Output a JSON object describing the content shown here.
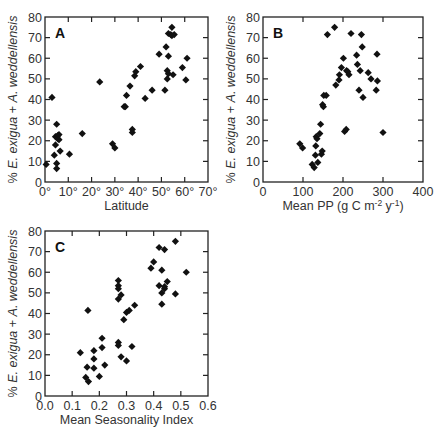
{
  "chart_data": [
    {
      "id": "A",
      "type": "scatter",
      "panel_label": "A",
      "title": "",
      "xlabel": "Latitude",
      "ylabel": "% E. exigua + A. weddellensis",
      "ylabel_parts": {
        "pre": "% ",
        "italic1": "E. exigua",
        "mid": " + ",
        "italic2": "A. weddellensis"
      },
      "xlim": [
        0,
        70
      ],
      "ylim": [
        0,
        80
      ],
      "xticks": [
        0,
        10,
        20,
        30,
        40,
        50,
        60,
        70
      ],
      "xtick_labels": [
        "0°",
        "10°",
        "20°",
        "30°",
        "40°",
        "50°",
        "60°",
        "70°"
      ],
      "yticks": [
        0,
        10,
        20,
        30,
        40,
        50,
        60,
        70,
        80
      ],
      "ytick_labels": [
        "0",
        "10",
        "20",
        "30",
        "40",
        "50",
        "60",
        "70",
        "80"
      ],
      "grid": false,
      "marker": "diamond",
      "points": [
        [
          0.5,
          8.5
        ],
        [
          3,
          41
        ],
        [
          4,
          13
        ],
        [
          4.5,
          18
        ],
        [
          4.5,
          22
        ],
        [
          5,
          28
        ],
        [
          5,
          9
        ],
        [
          5,
          6.5
        ],
        [
          5.5,
          22.5
        ],
        [
          5.5,
          21
        ],
        [
          6,
          23
        ],
        [
          6,
          20.5
        ],
        [
          6.5,
          15
        ],
        [
          10.5,
          13.5
        ],
        [
          16,
          23.5
        ],
        [
          23.5,
          48.5
        ],
        [
          29,
          18.5
        ],
        [
          30,
          16.5
        ],
        [
          34,
          36.5
        ],
        [
          34.5,
          36.5
        ],
        [
          35,
          42
        ],
        [
          36.5,
          46.5
        ],
        [
          37.5,
          25.5
        ],
        [
          37.5,
          24
        ],
        [
          38.5,
          51.5
        ],
        [
          39,
          53.5
        ],
        [
          41,
          56
        ],
        [
          43,
          40.5
        ],
        [
          46,
          44.5
        ],
        [
          49,
          62
        ],
        [
          51.5,
          44.5
        ],
        [
          52,
          65.5
        ],
        [
          52.5,
          50
        ],
        [
          52.5,
          54
        ],
        [
          53,
          72
        ],
        [
          53,
          61
        ],
        [
          53,
          52.5
        ],
        [
          54,
          71.5
        ],
        [
          54.5,
          75
        ],
        [
          54.5,
          71
        ],
        [
          55,
          52
        ],
        [
          55.5,
          71.5
        ],
        [
          59,
          55.5
        ],
        [
          60.5,
          49.5
        ],
        [
          61,
          60
        ]
      ]
    },
    {
      "id": "B",
      "type": "scatter",
      "panel_label": "B",
      "title": "",
      "xlabel": "Mean PP (g C m-2 y-1)",
      "xlabel_parts": {
        "main": "Mean PP (g C m",
        "sup1": "-2",
        "mid": " y",
        "sup2": "-1",
        "end": ")"
      },
      "ylabel": "% E. exigua + A. weddellensis",
      "ylabel_parts": {
        "pre": "% ",
        "italic1": "E. exigua",
        "mid": " + ",
        "italic2": "A. weddellensis"
      },
      "xlim": [
        0,
        400
      ],
      "ylim": [
        0,
        80
      ],
      "xticks": [
        0,
        100,
        200,
        300,
        400
      ],
      "xtick_labels": [
        "0",
        "100",
        "200",
        "300",
        "400"
      ],
      "yticks": [
        0,
        10,
        20,
        30,
        40,
        50,
        60,
        70,
        80
      ],
      "ytick_labels": [
        "0",
        "10",
        "20",
        "30",
        "40",
        "50",
        "60",
        "70",
        "80"
      ],
      "grid": false,
      "marker": "diamond",
      "points": [
        [
          92,
          18.5
        ],
        [
          99,
          16.5
        ],
        [
          123,
          8.5
        ],
        [
          128,
          7
        ],
        [
          131,
          13
        ],
        [
          132,
          17.5
        ],
        [
          133,
          22
        ],
        [
          135,
          21
        ],
        [
          137,
          9.5
        ],
        [
          142,
          23.5
        ],
        [
          144,
          28
        ],
        [
          146,
          13.5
        ],
        [
          148,
          15
        ],
        [
          149,
          37.5
        ],
        [
          151,
          36.5
        ],
        [
          152,
          42
        ],
        [
          158,
          42
        ],
        [
          161,
          71.5
        ],
        [
          179,
          75
        ],
        [
          182,
          47
        ],
        [
          190,
          49.5
        ],
        [
          191,
          52
        ],
        [
          196,
          55.5
        ],
        [
          201,
          60
        ],
        [
          204,
          24.5
        ],
        [
          208,
          25.5
        ],
        [
          209,
          54
        ],
        [
          212,
          53.5
        ],
        [
          215,
          52
        ],
        [
          220,
          72
        ],
        [
          234,
          61.5
        ],
        [
          236,
          57
        ],
        [
          240,
          44.5
        ],
        [
          243,
          54
        ],
        [
          246,
          71.5
        ],
        [
          248,
          65.5
        ],
        [
          250,
          41
        ],
        [
          263,
          53
        ],
        [
          270,
          50
        ],
        [
          283,
          44.5
        ],
        [
          285,
          62
        ],
        [
          286,
          49
        ],
        [
          300,
          24
        ]
      ]
    },
    {
      "id": "C",
      "type": "scatter",
      "panel_label": "C",
      "title": "",
      "xlabel": "Mean Seasonality Index",
      "ylabel": "% E. exigua + A. weddellensis",
      "ylabel_parts": {
        "pre": "% ",
        "italic1": "E. exigua",
        "mid": " + ",
        "italic2": "A. weddellensis"
      },
      "xlim": [
        0.0,
        0.6
      ],
      "ylim": [
        0,
        80
      ],
      "xticks": [
        0.0,
        0.1,
        0.2,
        0.3,
        0.4,
        0.5,
        0.6
      ],
      "xtick_labels": [
        "0.0",
        "0.1",
        "0.2",
        "0.3",
        "0.4",
        "0.5",
        "0.6"
      ],
      "yticks": [
        0,
        10,
        20,
        30,
        40,
        50,
        60,
        70,
        80
      ],
      "ytick_labels": [
        "0",
        "10",
        "20",
        "30",
        "40",
        "50",
        "60",
        "70",
        "80"
      ],
      "grid": false,
      "marker": "diamond",
      "points": [
        [
          0.13,
          21
        ],
        [
          0.15,
          9
        ],
        [
          0.155,
          14
        ],
        [
          0.158,
          41.5
        ],
        [
          0.16,
          7
        ],
        [
          0.18,
          22
        ],
        [
          0.18,
          18
        ],
        [
          0.18,
          13.5
        ],
        [
          0.2,
          9.5
        ],
        [
          0.21,
          28
        ],
        [
          0.21,
          23.5
        ],
        [
          0.22,
          15
        ],
        [
          0.27,
          56
        ],
        [
          0.27,
          53.5
        ],
        [
          0.27,
          52
        ],
        [
          0.27,
          47
        ],
        [
          0.27,
          26
        ],
        [
          0.27,
          24.5
        ],
        [
          0.28,
          49
        ],
        [
          0.28,
          19
        ],
        [
          0.29,
          37
        ],
        [
          0.3,
          40.5
        ],
        [
          0.3,
          17
        ],
        [
          0.31,
          41.5
        ],
        [
          0.32,
          24
        ],
        [
          0.33,
          44
        ],
        [
          0.39,
          62
        ],
        [
          0.4,
          65
        ],
        [
          0.42,
          72
        ],
        [
          0.42,
          53.5
        ],
        [
          0.43,
          61
        ],
        [
          0.43,
          50
        ],
        [
          0.43,
          44.5
        ],
        [
          0.44,
          71
        ],
        [
          0.44,
          52
        ],
        [
          0.44,
          53
        ],
        [
          0.45,
          55.5
        ],
        [
          0.48,
          75
        ],
        [
          0.48,
          49.5
        ],
        [
          0.52,
          60
        ]
      ]
    }
  ],
  "layout": {
    "panels": [
      {
        "id": "A",
        "left": 45,
        "top": 17,
        "width": 163,
        "height": 165
      },
      {
        "id": "B",
        "left": 263,
        "top": 17,
        "width": 160,
        "height": 165
      },
      {
        "id": "C",
        "left": 45,
        "top": 231,
        "width": 163,
        "height": 165
      }
    ]
  },
  "colors": {
    "marker": "#111111",
    "axis": "#222222",
    "text": "#333333",
    "background": "#ffffff"
  }
}
